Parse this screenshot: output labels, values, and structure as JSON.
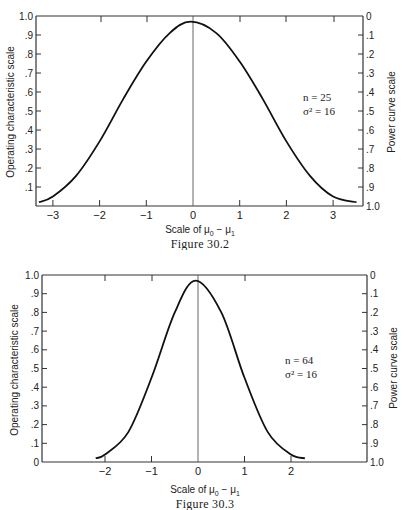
{
  "figures": [
    {
      "caption": "Figure 30.2",
      "left_axis_label": "Operating characteristic scale",
      "right_axis_label": "Power curve scale",
      "x_axis_label": "Scale of μ0 − μ1",
      "annotation": [
        "n = 25",
        "σ² = 16"
      ],
      "left_ticks": [
        "1.0",
        ".9",
        ".8",
        ".7",
        ".6",
        ".5",
        ".4",
        ".3",
        ".2",
        ".1"
      ],
      "right_ticks": [
        "0",
        ".1",
        ".2",
        ".3",
        ".4",
        ".5",
        ".6",
        ".7",
        ".8",
        ".9",
        "1.0"
      ],
      "x_ticks": [
        "−3",
        "−2",
        "−1",
        "0",
        "1",
        "2",
        "3"
      ]
    },
    {
      "caption": "Figure 30.3",
      "left_axis_label": "Operating characteristic scale",
      "right_axis_label": "Power curve scale",
      "x_axis_label": "Scale of μ0 − μ1",
      "annotation": [
        "n = 64",
        "σ² = 16"
      ],
      "left_ticks": [
        "1.0",
        ".9",
        ".8",
        ".7",
        ".6",
        ".5",
        ".4",
        ".3",
        ".2",
        ".1",
        "0"
      ],
      "right_ticks": [
        "0",
        ".1",
        ".2",
        ".3",
        ".4",
        ".5",
        ".6",
        ".7",
        ".8",
        ".9",
        "1.0"
      ],
      "x_ticks": [
        "−2",
        "−1",
        "0",
        "1",
        "2"
      ]
    }
  ],
  "chart_data": [
    {
      "type": "line",
      "title": "Figure 30.2",
      "xlabel": "Scale of μ0 − μ1",
      "ylabel": "Operating characteristic scale",
      "y2label": "Power curve scale",
      "xlim": [
        -3.3,
        3.6
      ],
      "ylim": [
        0,
        1.0
      ],
      "y2lim": [
        1.0,
        0
      ],
      "grid": false,
      "annotation": "n = 25, σ² = 16",
      "series": [
        {
          "name": "OC curve (n = 25)",
          "x": [
            -3.3,
            -3.0,
            -2.5,
            -2.0,
            -1.5,
            -1.0,
            -0.5,
            -0.05,
            0.5,
            1.0,
            1.5,
            2.0,
            2.5,
            3.0,
            3.5
          ],
          "y": [
            0.02,
            0.05,
            0.16,
            0.34,
            0.56,
            0.76,
            0.91,
            0.97,
            0.91,
            0.76,
            0.56,
            0.34,
            0.16,
            0.05,
            0.02
          ]
        }
      ]
    },
    {
      "type": "line",
      "title": "Figure 30.3",
      "xlabel": "Scale of μ0 − μ1",
      "ylabel": "Operating characteristic scale",
      "y2label": "Power curve scale",
      "xlim": [
        -3.3,
        3.6
      ],
      "ylim": [
        0,
        1.0
      ],
      "y2lim": [
        1.0,
        0
      ],
      "grid": false,
      "annotation": "n = 64, σ² = 16",
      "series": [
        {
          "name": "OC curve (n = 64)",
          "x": [
            -2.2,
            -2.0,
            -1.5,
            -1.0,
            -0.5,
            -0.05,
            0.5,
            1.0,
            1.5,
            2.0,
            2.3
          ],
          "y": [
            0.02,
            0.04,
            0.16,
            0.45,
            0.8,
            0.97,
            0.8,
            0.45,
            0.16,
            0.04,
            0.02
          ]
        }
      ]
    }
  ]
}
